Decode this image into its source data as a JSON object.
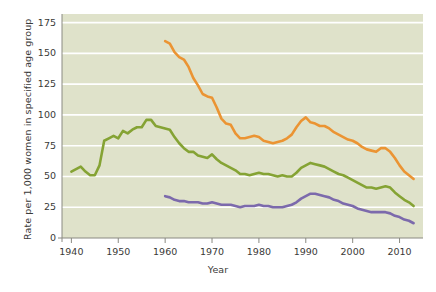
{
  "chart_data": {
    "type": "line",
    "title": "",
    "xlabel": "Year",
    "ylabel": "Rate per 1,000 women in specified age group",
    "xlim": [
      1938,
      2015
    ],
    "ylim": [
      0,
      182
    ],
    "xticks": [
      1940,
      1950,
      1960,
      1970,
      1980,
      1990,
      2000,
      2010
    ],
    "xtick_labels": [
      "1940",
      "1950",
      "1960",
      "1970",
      "1980",
      "1990",
      "2000",
      "2010"
    ],
    "yticks": [
      0,
      25,
      50,
      75,
      100,
      125,
      150,
      175
    ],
    "ytick_labels": [
      "0",
      "25",
      "50",
      "75",
      "100",
      "125",
      "150",
      "175"
    ],
    "grid": "horizontal",
    "legend_position": "inline-annotations",
    "plot_background": "#dfe2ca",
    "series": [
      {
        "name": "18–19 years",
        "color": "#eb9433",
        "label_x": 1984,
        "label_y": 104,
        "x": [
          1960,
          1961,
          1962,
          1963,
          1964,
          1965,
          1966,
          1967,
          1968,
          1969,
          1970,
          1971,
          1972,
          1973,
          1974,
          1975,
          1976,
          1977,
          1978,
          1979,
          1980,
          1981,
          1982,
          1983,
          1984,
          1985,
          1986,
          1987,
          1988,
          1989,
          1990,
          1991,
          1992,
          1993,
          1994,
          1995,
          1996,
          1997,
          1998,
          1999,
          2000,
          2001,
          2002,
          2003,
          2004,
          2005,
          2006,
          2007,
          2008,
          2009,
          2010,
          2011,
          2012,
          2013
        ],
        "y": [
          160,
          158,
          151,
          147,
          145,
          139,
          130,
          124,
          117,
          115,
          114,
          106,
          97,
          93,
          92,
          85,
          81,
          81,
          82,
          83,
          82,
          79,
          78,
          77,
          78,
          79,
          81,
          84,
          90,
          95,
          98,
          94,
          93,
          91,
          91,
          89,
          86,
          84,
          82,
          80,
          79,
          77,
          74,
          72,
          71,
          70,
          73,
          73,
          70,
          65,
          59,
          54,
          51,
          48
        ]
      },
      {
        "name": "15–19 years",
        "color": "#85a334",
        "label_x": 1980,
        "label_y": 62,
        "x": [
          1940,
          1941,
          1942,
          1943,
          1944,
          1945,
          1946,
          1947,
          1948,
          1949,
          1950,
          1951,
          1952,
          1953,
          1954,
          1955,
          1956,
          1957,
          1958,
          1959,
          1960,
          1961,
          1962,
          1963,
          1964,
          1965,
          1966,
          1967,
          1968,
          1969,
          1970,
          1971,
          1972,
          1973,
          1974,
          1975,
          1976,
          1977,
          1978,
          1979,
          1980,
          1981,
          1982,
          1983,
          1984,
          1985,
          1986,
          1987,
          1988,
          1989,
          1990,
          1991,
          1992,
          1993,
          1994,
          1995,
          1996,
          1997,
          1998,
          1999,
          2000,
          2001,
          2002,
          2003,
          2004,
          2005,
          2006,
          2007,
          2008,
          2009,
          2010,
          2011,
          2012,
          2013
        ],
        "y": [
          54,
          56,
          58,
          54,
          51,
          51,
          59,
          79,
          81,
          83,
          81,
          87,
          85,
          88,
          90,
          90,
          96,
          96,
          91,
          90,
          89,
          88,
          82,
          77,
          73,
          70,
          70,
          67,
          66,
          65,
          68,
          64,
          61,
          59,
          57,
          55,
          52,
          52,
          51,
          52,
          53,
          52,
          52,
          51,
          50,
          51,
          50,
          50,
          53,
          57,
          59,
          61,
          60,
          59,
          58,
          56,
          54,
          52,
          51,
          49,
          47,
          45,
          43,
          41,
          41,
          40,
          41,
          42,
          41,
          37,
          34,
          31,
          29,
          26
        ]
      },
      {
        "name": "15–17 years",
        "color": "#7c6aac",
        "label_x": 1980,
        "label_y": 19,
        "x": [
          1960,
          1961,
          1962,
          1963,
          1964,
          1965,
          1966,
          1967,
          1968,
          1969,
          1970,
          1971,
          1972,
          1973,
          1974,
          1975,
          1976,
          1977,
          1978,
          1979,
          1980,
          1981,
          1982,
          1983,
          1984,
          1985,
          1986,
          1987,
          1988,
          1989,
          1990,
          1991,
          1992,
          1993,
          1994,
          1995,
          1996,
          1997,
          1998,
          1999,
          2000,
          2001,
          2002,
          2003,
          2004,
          2005,
          2006,
          2007,
          2008,
          2009,
          2010,
          2011,
          2012,
          2013
        ],
        "y": [
          34,
          33,
          31,
          30,
          30,
          29,
          29,
          29,
          28,
          28,
          29,
          28,
          27,
          27,
          27,
          26,
          25,
          26,
          26,
          26,
          27,
          26,
          26,
          25,
          25,
          25,
          26,
          27,
          29,
          32,
          34,
          36,
          36,
          35,
          34,
          33,
          31,
          30,
          28,
          27,
          26,
          24,
          23,
          22,
          21,
          21,
          21,
          21,
          20,
          18,
          17,
          15,
          14,
          12
        ]
      }
    ]
  },
  "axes": {
    "y_title": "Rate per 1,000 women in specified age group",
    "x_title": "Year"
  }
}
